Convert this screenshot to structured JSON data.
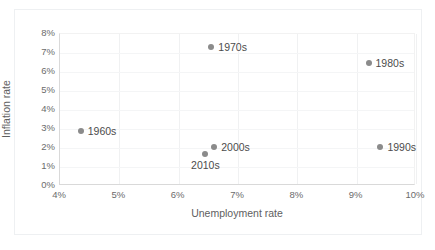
{
  "chart_data": {
    "type": "scatter",
    "title": "",
    "xlabel": "Unemployment rate",
    "ylabel": "Inflation rate",
    "xlim": [
      4,
      10
    ],
    "ylim": [
      0,
      8
    ],
    "xticks": [
      "4%",
      "5%",
      "6%",
      "7%",
      "8%",
      "9%",
      "10%"
    ],
    "xtick_values": [
      4,
      5,
      6,
      7,
      8,
      9,
      10
    ],
    "yticks": [
      "0%",
      "1%",
      "2%",
      "3%",
      "4%",
      "5%",
      "6%",
      "7%",
      "8%"
    ],
    "ytick_values": [
      0,
      1,
      2,
      3,
      4,
      5,
      6,
      7,
      8
    ],
    "grid": "both",
    "legend": "none",
    "marker_color": "#8b8b8b",
    "points": [
      {
        "label": "1960s",
        "x": 4.35,
        "y": 2.9,
        "label_position": "right"
      },
      {
        "label": "1970s",
        "x": 6.55,
        "y": 7.3,
        "label_position": "right"
      },
      {
        "label": "1980s",
        "x": 9.2,
        "y": 6.5,
        "label_position": "right"
      },
      {
        "label": "1990s",
        "x": 9.4,
        "y": 2.05,
        "label_position": "right"
      },
      {
        "label": "2000s",
        "x": 6.6,
        "y": 2.05,
        "label_position": "right"
      },
      {
        "label": "2010s",
        "x": 6.45,
        "y": 1.7,
        "label_position": "below"
      }
    ]
  }
}
